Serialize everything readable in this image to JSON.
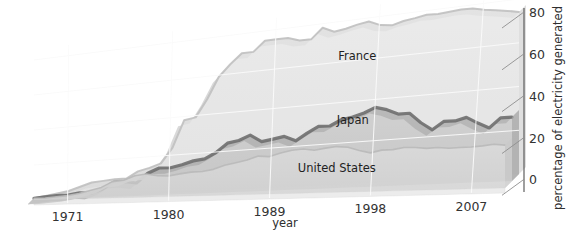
{
  "chart_data": {
    "type": "area",
    "title": "",
    "subtitle": "",
    "xlabel": "year",
    "ylabel": "percentage of electricity generated",
    "xlim": [
      1968,
      2010
    ],
    "ylim": [
      0,
      88
    ],
    "grid": true,
    "legend_position": "inline-labels",
    "style": "3d-stacked-ribbon",
    "x_ticks": [
      "1971",
      "1980",
      "1989",
      "1998",
      "2007"
    ],
    "x_tick_values": [
      1971,
      1980,
      1989,
      1998,
      2007
    ],
    "y_ticks": [
      "0",
      "20",
      "40",
      "60",
      "80"
    ],
    "y_tick_values": [
      0,
      20,
      40,
      60,
      80
    ],
    "x": [
      1968,
      1969,
      1970,
      1971,
      1972,
      1973,
      1974,
      1975,
      1976,
      1977,
      1978,
      1979,
      1980,
      1981,
      1982,
      1983,
      1984,
      1985,
      1986,
      1987,
      1988,
      1989,
      1990,
      1991,
      1992,
      1993,
      1994,
      1995,
      1996,
      1997,
      1998,
      1999,
      2000,
      2001,
      2002,
      2003,
      2004,
      2005,
      2006,
      2007,
      2008,
      2009,
      2010
    ],
    "series": [
      {
        "name": "United States",
        "color": "#d9d9d9",
        "values": [
          1,
          1,
          1.5,
          2,
          3,
          4.5,
          6,
          9,
          9.5,
          11.8,
          12.5,
          11.4,
          11,
          11.9,
          12.6,
          12.7,
          13.6,
          15.5,
          16.6,
          17.7,
          19.5,
          19,
          20.6,
          21.7,
          22.1,
          21.2,
          22.0,
          22.5,
          21.9,
          20.1,
          18.7,
          19.8,
          19.8,
          20.6,
          20.3,
          19.7,
          19.9,
          19.3,
          19.4,
          19.4,
          19.7,
          20.2,
          19.6
        ]
      },
      {
        "name": "Japan",
        "color": "#bdbdbd",
        "values": [
          1,
          1.5,
          2,
          2,
          3,
          2.5,
          4.5,
          8,
          8,
          7,
          12,
          14.5,
          14.3,
          15.6,
          17.3,
          18,
          21,
          25.5,
          26.5,
          28.9,
          25.2,
          26.1,
          27.1,
          24.5,
          28,
          31,
          30.8,
          33.5,
          34.4,
          36.0,
          38.3,
          36.8,
          34.3,
          34.3,
          29.4,
          25.7,
          29.3,
          29.2,
          30.5,
          27.5,
          24.9,
          29.2,
          29.2
        ]
      },
      {
        "name": "France",
        "color": "#e3e3e3",
        "values": [
          1,
          2,
          3,
          4,
          6,
          8,
          8.5,
          9,
          9,
          12.5,
          14,
          16,
          24,
          38,
          39,
          48,
          59,
          65,
          70,
          70,
          75,
          75,
          75,
          73,
          72.9,
          78,
          75.3,
          76.1,
          77.4,
          78.2,
          75.8,
          75,
          76.4,
          77.1,
          78,
          77.7,
          78.1,
          78.5,
          78.3,
          77.0,
          76.2,
          75.2,
          74.1
        ]
      }
    ],
    "annotations": [
      {
        "text": "France",
        "x": 1996,
        "y": 60
      },
      {
        "text": "Japan",
        "x": 1996,
        "y": 31
      },
      {
        "text": "United States",
        "x": 1995,
        "y": 10
      }
    ]
  },
  "axes": {
    "x_title": "year",
    "y_title": "percentage of electricity generated",
    "x_tick_labels": [
      "1971",
      "1980",
      "1989",
      "1998",
      "2007"
    ],
    "y_tick_labels": [
      "80",
      "60",
      "40",
      "20",
      "0"
    ]
  },
  "labels": {
    "france": "France",
    "japan": "Japan",
    "united_states": "United States"
  },
  "colors": {
    "background": "#ffffff",
    "france_fill": "#e2e2e2",
    "japan_fill": "#bcbcbc",
    "us_fill": "#d8d8d8",
    "japan_edge": "#7d7d7d",
    "grid": "#f4f4f4",
    "axis": "#5a5a5a",
    "text": "#2a2a2a"
  }
}
